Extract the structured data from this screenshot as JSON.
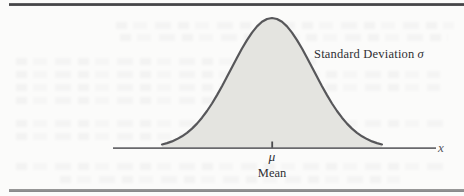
{
  "figure": {
    "curve_label": {
      "text": "Standard Deviation",
      "symbol": "σ"
    },
    "axis_label": "x",
    "mu_label": "μ",
    "mean_label": "Mean"
  },
  "colors": {
    "curve_fill": "#e4e4e0",
    "curve_stroke": "#57575a",
    "axis_line": "#69696c",
    "tick": "#4b4b4d",
    "top_rule": "#434345",
    "bottom_rule": "#8d8d8d",
    "text": "#2f2f33",
    "page_background": "#fbfbfa"
  }
}
